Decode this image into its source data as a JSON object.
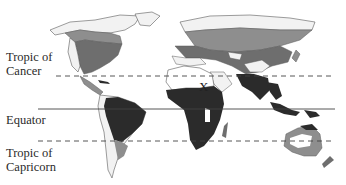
{
  "map": {
    "title": "World map with latitude lines and shaded climate/vegetation regions",
    "marker": "X",
    "lines": [
      {
        "name": "Tropic of Cancer",
        "label_line1": "Tropic of",
        "label_line2": "Cancer",
        "style": "dashed"
      },
      {
        "name": "Equator",
        "label_line1": "Equator",
        "label_line2": "",
        "style": "solid"
      },
      {
        "name": "Tropic of Capricorn",
        "label_line1": "Tropic of",
        "label_line2": "Capricorn",
        "style": "dashed"
      }
    ],
    "colors": {
      "land_outline": "#5a5a5a",
      "light_region": "#f2f2f2",
      "medium_region": "#8e8e8e",
      "mid_dark_region": "#6e6e6e",
      "dark_region": "#2b2b2b",
      "line": "#444444",
      "background": "#ffffff"
    }
  }
}
